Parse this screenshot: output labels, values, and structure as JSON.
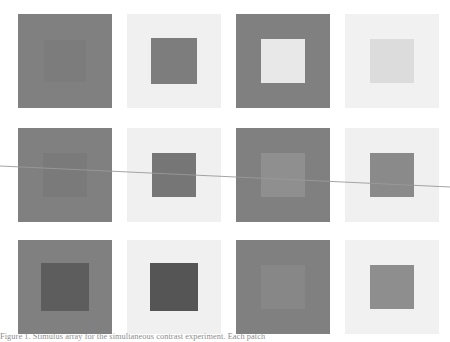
{
  "figure": {
    "background_color": "#ffffff",
    "width": 450,
    "height": 342,
    "grid": {
      "rows": 3,
      "columns": 4,
      "row_tops": [
        14,
        128,
        240
      ],
      "row_height": 94,
      "cell_lefts": [
        18,
        127,
        236,
        345
      ],
      "cell_width": 94,
      "cells": [
        {
          "id": "cell-r1c1",
          "row": 1,
          "column": 1,
          "surround_color": "#808080",
          "target_color": "#7c7c7c",
          "target_inset": 26,
          "target_size": 42,
          "contrast_label": "low"
        },
        {
          "id": "cell-r1c2",
          "row": 1,
          "column": 2,
          "surround_color": "#f0f0f0",
          "target_color": "#7d7d7d",
          "target_inset": 24,
          "target_size": 46,
          "contrast_label": "high"
        },
        {
          "id": "cell-r1c3",
          "row": 1,
          "column": 3,
          "surround_color": "#808080",
          "target_color": "#e8e8e8",
          "target_inset": 25,
          "target_size": 44,
          "contrast_label": "high"
        },
        {
          "id": "cell-r1c4",
          "row": 1,
          "column": 4,
          "surround_color": "#f1f1f1",
          "target_color": "#dcdcdc",
          "target_inset": 25,
          "target_size": 44,
          "contrast_label": "low"
        },
        {
          "id": "cell-r2c1",
          "row": 2,
          "column": 1,
          "surround_color": "#808080",
          "target_color": "#7a7a7a",
          "target_inset": 25,
          "target_size": 44,
          "contrast_label": "very-low"
        },
        {
          "id": "cell-r2c2",
          "row": 2,
          "column": 2,
          "surround_color": "#f0f0f0",
          "target_color": "#767676",
          "target_inset": 25,
          "target_size": 44,
          "contrast_label": "high"
        },
        {
          "id": "cell-r2c3",
          "row": 2,
          "column": 3,
          "surround_color": "#808080",
          "target_color": "#8f8f8f",
          "target_inset": 25,
          "target_size": 44,
          "contrast_label": "low"
        },
        {
          "id": "cell-r2c4",
          "row": 2,
          "column": 4,
          "surround_color": "#f0f0f0",
          "target_color": "#8a8a8a",
          "target_inset": 25,
          "target_size": 44,
          "contrast_label": "medium"
        },
        {
          "id": "cell-r3c1",
          "row": 3,
          "column": 1,
          "surround_color": "#808080",
          "target_color": "#5d5d5d",
          "target_inset": 23,
          "target_size": 48,
          "contrast_label": "medium"
        },
        {
          "id": "cell-r3c2",
          "row": 3,
          "column": 2,
          "surround_color": "#f0f0f0",
          "target_color": "#555555",
          "target_inset": 23,
          "target_size": 48,
          "contrast_label": "high"
        },
        {
          "id": "cell-r3c3",
          "row": 3,
          "column": 3,
          "surround_color": "#808080",
          "target_color": "#878787",
          "target_inset": 25,
          "target_size": 44,
          "contrast_label": "very-low"
        },
        {
          "id": "cell-r3c4",
          "row": 3,
          "column": 4,
          "surround_color": "#f1f1f1",
          "target_color": "#8e8e8e",
          "target_inset": 25,
          "target_size": 44,
          "contrast_label": "medium"
        }
      ]
    },
    "scan_line": {
      "color": "#9a9a9a",
      "stroke_width": 0.9,
      "x1": 0,
      "y1": 166,
      "x2": 450,
      "y2": 187
    },
    "caption": {
      "top": 331,
      "line1": "Figure 1.  Stimulus array for the simultaneous contrast experiment. Each patch",
      "line2": ""
    }
  }
}
